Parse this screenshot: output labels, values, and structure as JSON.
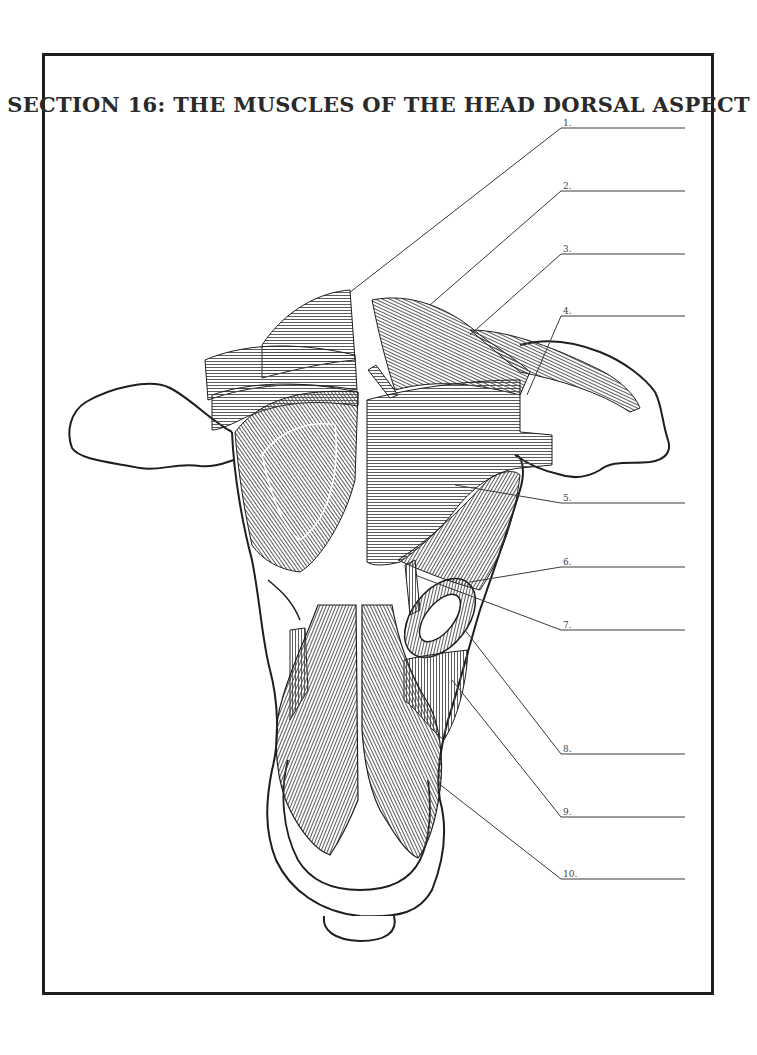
{
  "title": "SECTION 16: THE MUSCLES OF THE HEAD DORSAL ASPECT",
  "labels": [
    {
      "number": "1.",
      "answer": ""
    },
    {
      "number": "2.",
      "answer": ""
    },
    {
      "number": "3.",
      "answer": ""
    },
    {
      "number": "4.",
      "answer": ""
    },
    {
      "number": "5.",
      "answer": ""
    },
    {
      "number": "6.",
      "answer": ""
    },
    {
      "number": "7.",
      "answer": ""
    },
    {
      "number": "8.",
      "answer": ""
    },
    {
      "number": "9.",
      "answer": ""
    },
    {
      "number": "10.",
      "answer": ""
    }
  ],
  "colors": {
    "ink": "#1e1e1e",
    "hatch": "#555555",
    "background": "#ffffff"
  }
}
